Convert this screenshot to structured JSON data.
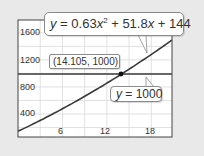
{
  "chart_data": {
    "type": "line",
    "title": "",
    "xlabel": "",
    "ylabel": "",
    "xlim": [
      0,
      20.8
    ],
    "ylim": [
      60,
      1790
    ],
    "grid": true,
    "x_ticks": [
      6,
      12,
      18
    ],
    "y_ticks": [
      400,
      800,
      1200,
      1600
    ],
    "x_tick_labels": [
      "6",
      "12",
      "18"
    ],
    "y_tick_labels": [
      "400",
      "800",
      "1200",
      "1600"
    ],
    "series": [
      {
        "name": "y = 0.63x^2 + 51.8x + 144",
        "kind": "quadratic",
        "coefficients": {
          "a": 0.63,
          "b": 51.8,
          "c": 144
        },
        "x": [
          0,
          2,
          4,
          6,
          8,
          10,
          12,
          14,
          16,
          18,
          20,
          20.8
        ],
        "values": [
          144,
          250,
          361,
          478,
          599,
          725,
          856,
          992,
          134,
          1293,
          1432,
          1494
        ],
        "color": "#3a3a3a"
      },
      {
        "name": "y = 1000",
        "kind": "horizontal",
        "x": [
          0,
          20.8
        ],
        "values": [
          1000,
          1000
        ],
        "color": "#3a3a3a"
      }
    ],
    "annotations": [
      {
        "text": "y = 0.63x² + 51.8x + 144",
        "target": "curve"
      },
      {
        "text": "(14.105, 1000)",
        "x": 14.105,
        "y": 1000,
        "marker": true
      },
      {
        "text": "y = 1000",
        "target": "horizontal line"
      }
    ]
  },
  "labels": {
    "eq_y": "y",
    "eq_mid": " = 0.63",
    "eq_x": "x",
    "eq_sup": "2",
    "eq_rest1": " + 51.8",
    "eq_x2": "x",
    "eq_rest2": " + 144",
    "point": "(14.105, 1000)",
    "line_y": "y",
    "line_rest": " = 1000",
    "y_ticks": [
      "1600",
      "1200",
      "800",
      "400"
    ],
    "x_ticks": [
      "6",
      "12",
      "18"
    ]
  },
  "colors": {
    "background": "#e9e9e9",
    "plot_bg": "#ffffff",
    "grid": "#d8d8d8",
    "line": "#3a3a3a",
    "frame": "#444444"
  }
}
